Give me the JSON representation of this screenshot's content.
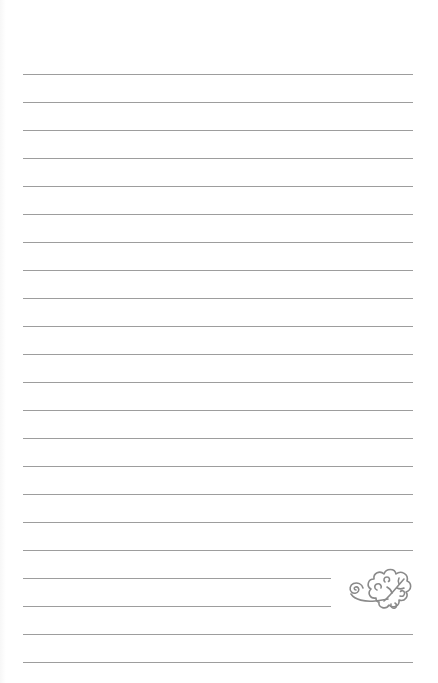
{
  "page": {
    "type": "lined-notepaper",
    "background_color": "#ffffff",
    "rule_color": "#9d9d9d",
    "rule_count": 22,
    "rule_spacing_px": 28,
    "first_rule_y": 74,
    "rule_left_x": 23,
    "rule_right_x": 413,
    "short_rule_indices": [
      18,
      19
    ],
    "short_rule_right_x": 331
  },
  "decoration": {
    "icon": "swirl-leaf-flourish-icon",
    "color": "#8a8a8a"
  }
}
